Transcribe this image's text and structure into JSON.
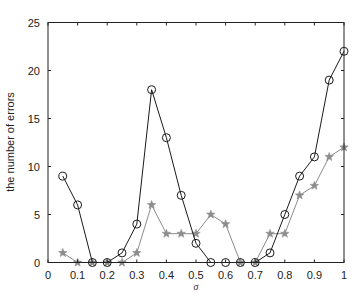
{
  "chart_data": {
    "type": "line",
    "title": "",
    "xlabel": "σ",
    "ylabel": "the number of errors",
    "xlim": [
      0,
      1
    ],
    "ylim": [
      0,
      25
    ],
    "xticks": [
      "0",
      "0.1",
      "0.2",
      "0.3",
      "0.4",
      "0.5",
      "0.6",
      "0.7",
      "0.8",
      "0.9",
      "1"
    ],
    "yticks": [
      "0",
      "5",
      "10",
      "15",
      "20",
      "25"
    ],
    "grid": false,
    "legend": null,
    "x": [
      0.05,
      0.1,
      0.15,
      0.2,
      0.25,
      0.3,
      0.35,
      0.4,
      0.45,
      0.5,
      0.55,
      0.6,
      0.65,
      0.7,
      0.75,
      0.8,
      0.85,
      0.9,
      0.95,
      1.0
    ],
    "series": [
      {
        "name": "circle-series",
        "marker": "o",
        "color": "#1a1a1a",
        "values": [
          9,
          6,
          0,
          0,
          1,
          4,
          18,
          13,
          7,
          2,
          0,
          0,
          0,
          0,
          1,
          5,
          9,
          11,
          19,
          22
        ]
      },
      {
        "name": "star-series",
        "marker": "*",
        "color": "#8c8c8c",
        "values": [
          1,
          0,
          0,
          0,
          0,
          1,
          6,
          3,
          3,
          3,
          5,
          4,
          0,
          0,
          3,
          3,
          7,
          8,
          11,
          12
        ]
      }
    ]
  }
}
